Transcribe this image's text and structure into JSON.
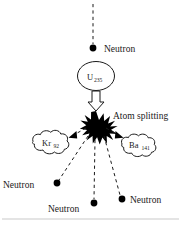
{
  "diagram": {
    "colors": {
      "ink": "#1a1a1a",
      "fill": "#000000",
      "paper": "#ffffff",
      "frame": "#c9c9c9"
    },
    "incoming": {
      "neutron_label": "Neutron"
    },
    "nucleus": {
      "element": "U",
      "mass_number": "235"
    },
    "event": {
      "label": "Atom splitting"
    },
    "fragments": [
      {
        "element": "Kr",
        "mass_number": "92"
      },
      {
        "element": "Ba",
        "mass_number": "141"
      }
    ],
    "emitted_neutrons": [
      {
        "label": "Neutron"
      },
      {
        "label": "Neutron"
      },
      {
        "label": "Neutron"
      }
    ]
  }
}
